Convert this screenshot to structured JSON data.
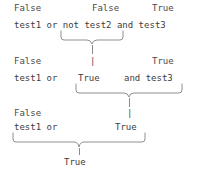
{
  "diagram": {
    "text_color": "#444444",
    "brace_color": "#8f8f8f",
    "background": "#ffffff",
    "steps": [
      {
        "step": 1,
        "labels": [
          {
            "text": "False",
            "over": "test1"
          },
          {
            "text": "False",
            "over": "test2"
          },
          {
            "text": "True",
            "over": "test3"
          }
        ],
        "expression": "test1 or not test2 and test3",
        "tokens": [
          "test1",
          "or",
          "not",
          "test2",
          "and",
          "test3"
        ],
        "grouped": "not test2",
        "grouped_result": "True"
      },
      {
        "step": 2,
        "labels": [
          {
            "text": "False",
            "over": "test1"
          },
          {
            "text": "|",
            "over": "True"
          },
          {
            "text": "True",
            "over": "test3"
          }
        ],
        "expression": "test1 or  True    and test3",
        "tokens": [
          "test1",
          "or",
          "True",
          "and",
          "test3"
        ],
        "grouped": "True and test3",
        "grouped_result": "True"
      },
      {
        "step": 3,
        "labels": [
          {
            "text": "False",
            "over": "test1"
          },
          {
            "text": "|",
            "over": "True"
          }
        ],
        "expression": "test1 or        True",
        "tokens": [
          "test1",
          "or",
          "True"
        ],
        "grouped": "test1 or True",
        "grouped_result": "True"
      }
    ],
    "rows": {
      "r1_label_false_a": "False",
      "r1_label_false_b": "False",
      "r1_label_true": "True",
      "r1_expr": "test1 or not test2 and test3",
      "r2_label_false": "False",
      "r2_label_bar": "|",
      "r2_label_true": "True",
      "r2_expr_left": "test1 or",
      "r2_expr_mid": "True",
      "r2_expr_right": "and test3",
      "r3_label_false": "False",
      "r3_label_bar": "|",
      "r3_expr_left": "test1 or",
      "r3_expr_right": "True",
      "final_result": "True"
    }
  }
}
